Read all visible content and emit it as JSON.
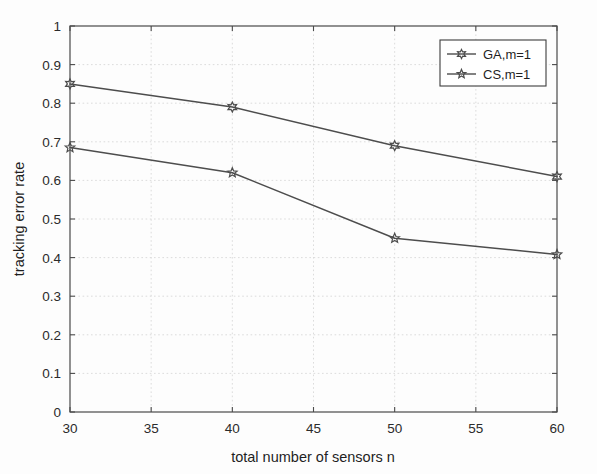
{
  "chart_data": {
    "type": "line",
    "title": "",
    "xlabel": "total number of sensors n",
    "ylabel": "tracking error rate",
    "x": [
      30,
      40,
      50,
      60
    ],
    "xlim": [
      30,
      60
    ],
    "ylim": [
      0,
      1
    ],
    "xticks": [
      "30",
      "35",
      "40",
      "45",
      "50",
      "55",
      "60"
    ],
    "xtick_values": [
      30,
      35,
      40,
      45,
      50,
      55,
      60
    ],
    "yticks": [
      "0",
      "0.1",
      "0.2",
      "0.3",
      "0.4",
      "0.5",
      "0.6",
      "0.7",
      "0.8",
      "0.9",
      "1"
    ],
    "ytick_values": [
      0,
      0.1,
      0.2,
      0.3,
      0.4,
      0.5,
      0.6,
      0.7,
      0.8,
      0.9,
      1
    ],
    "grid": true,
    "legend_position": "upper right",
    "series": [
      {
        "name": "GA,m=1",
        "marker": "hexagram-icon",
        "color": "#4d4d4d",
        "values": [
          0.85,
          0.79,
          0.69,
          0.61
        ]
      },
      {
        "name": "CS,m=1",
        "marker": "star-icon",
        "color": "#4d4d4d",
        "values": [
          0.685,
          0.62,
          0.45,
          0.408
        ]
      }
    ]
  },
  "legend": {
    "entries": [
      {
        "label": "GA,m=1"
      },
      {
        "label": "CS,m=1"
      }
    ]
  },
  "axes": {
    "x_title": "total number of sensors n",
    "y_title": "tracking error rate"
  }
}
